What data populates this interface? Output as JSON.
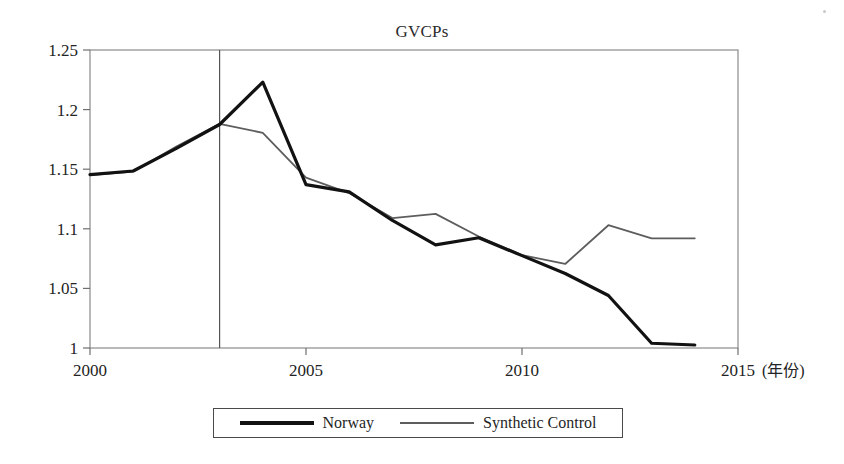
{
  "figure": {
    "title": "GVCPs",
    "background_color": "#ffffff",
    "frame_color": "#8a8a8a"
  },
  "legend": {
    "position": "below-axes",
    "entries": [
      {
        "label": "Norway",
        "color": "#121212",
        "swatch": "thick-solid-line"
      },
      {
        "label": "Synthetic Control",
        "color": "#5d5d5d",
        "swatch": "thin-solid-line"
      }
    ]
  },
  "axis": {
    "x_suffix_label": "(年份)",
    "x_ticks": [
      "2000",
      "2005",
      "2010",
      "2015"
    ],
    "y_ticks": [
      "1",
      "1.05",
      "1.1",
      "1.15",
      "1.2",
      "1.25"
    ]
  },
  "chart_data": {
    "type": "line",
    "title": "GVCPs",
    "xlabel": "(年份)",
    "ylabel": "",
    "xlim": [
      2000,
      2015
    ],
    "ylim": [
      1,
      1.25
    ],
    "x_ticks": [
      2000,
      2005,
      2010,
      2015
    ],
    "y_ticks": [
      1,
      1.05,
      1.1,
      1.15,
      1.2,
      1.25
    ],
    "grid": false,
    "legend_position": "bottom",
    "x": [
      2000,
      2001,
      2002,
      2003,
      2004,
      2005,
      2006,
      2007,
      2008,
      2009,
      2010,
      2011,
      2012,
      2013,
      2014
    ],
    "series": [
      {
        "name": "Norway",
        "color": "#121212",
        "line_width": 3.2,
        "values": [
          1.1455,
          1.1485,
          1.1675,
          1.1875,
          1.223,
          1.137,
          1.131,
          1.107,
          1.0865,
          1.0925,
          1.0775,
          1.0625,
          1.044,
          1.004,
          1.0025
        ]
      },
      {
        "name": "Synthetic Control",
        "color": "#5d5d5d",
        "line_width": 1.8,
        "values": [
          1.145,
          1.148,
          1.169,
          1.188,
          1.1805,
          1.143,
          1.13,
          1.109,
          1.1125,
          1.0935,
          1.078,
          1.0705,
          1.103,
          1.092,
          1.092
        ]
      }
    ],
    "annotations": [
      {
        "type": "vertical-reference-line",
        "x": 2003,
        "color": "#555555",
        "label": ""
      }
    ]
  }
}
